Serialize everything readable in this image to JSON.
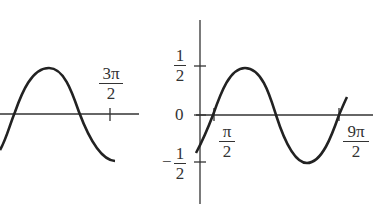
{
  "left_graph": {
    "x_tick_label": {
      "numerator": "3π",
      "denominator": "2"
    },
    "curve": "sine wave segment: crosses zero, peak, crosses zero, descends to trough"
  },
  "right_graph": {
    "y_ticks": [
      {
        "label_num": "1",
        "label_den": "2",
        "value": 0.5
      },
      {
        "label": "0",
        "value": 0
      },
      {
        "label_num": "1",
        "label_den": "2",
        "sign": "−",
        "value": -0.5
      }
    ],
    "x_ticks": [
      {
        "numerator": "π",
        "denominator": "2"
      },
      {
        "numerator": "9π",
        "denominator": "2"
      }
    ],
    "curve": "sine wave from π/2 to 9π/2 with amplitude 1/2"
  },
  "colors": {
    "stroke": "#222222",
    "background": "#ffffff"
  }
}
